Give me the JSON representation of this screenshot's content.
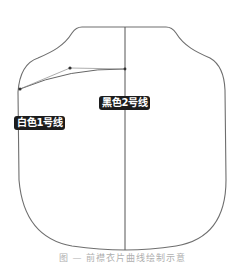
{
  "diagram": {
    "type": "garment-pattern-outline",
    "labels": {
      "black_line": "黑色2号线",
      "white_line": "白色1号线"
    },
    "caption": "图 — 前襟衣片曲线绘制示意",
    "colors": {
      "outline": "#6e6e6e",
      "center_line": "#555555",
      "label_bg": "#1c1c1c",
      "label_text": "#ffffff"
    },
    "shape": {
      "outline_path": "M82,27 L166,27 Q172,27 176,33 C184,46 196,52 210,58 Q224,66 225,90 L226,180 C226,215 212,240 176,246 Q150,250 125,250 Q100,250 72,246 C38,240 22,215 19,180 L18,92 Q20,64 38,58 C52,52 64,46 72,33 Q76,27 82,27 Z",
      "center_line": {
        "x": 125,
        "y1": 27,
        "y2": 250
      },
      "bezier_curve": "M20,89 Q70,68 125,69",
      "handle_start": [
        20,
        89
      ],
      "handle_control": [
        70,
        68
      ],
      "handle_end": [
        125,
        69
      ]
    }
  }
}
